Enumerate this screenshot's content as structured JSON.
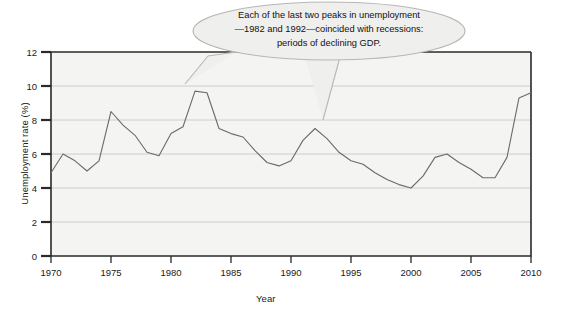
{
  "chart_data": {
    "type": "line",
    "title": "",
    "xlabel": "Year",
    "ylabel": "Unemployment rate (%)",
    "xlim": [
      1970,
      2010
    ],
    "ylim": [
      0,
      12
    ],
    "xticks": [
      1970,
      1975,
      1980,
      1985,
      1990,
      1995,
      2000,
      2005,
      2010
    ],
    "yticks": [
      0,
      2,
      4,
      6,
      8,
      10,
      12
    ],
    "xtick_labels": [
      "1970",
      "1975",
      "1980",
      "1985",
      "1990",
      "1995",
      "2000",
      "2005",
      "2010"
    ],
    "ytick_labels": [
      "0",
      "2",
      "4",
      "6",
      "8",
      "10",
      "12"
    ],
    "grid": "horizontal",
    "legend": "none",
    "series": [
      {
        "name": "Unemployment rate",
        "color": "#6a6a6a",
        "x": [
          1970,
          1971,
          1972,
          1973,
          1974,
          1975,
          1976,
          1977,
          1978,
          1979,
          1980,
          1981,
          1982,
          1983,
          1984,
          1985,
          1986,
          1987,
          1988,
          1989,
          1990,
          1991,
          1992,
          1993,
          1994,
          1995,
          1996,
          1997,
          1998,
          1999,
          2000,
          2001,
          2002,
          2003,
          2004,
          2005,
          2006,
          2007,
          2008,
          2009,
          2010
        ],
        "values": [
          4.9,
          6.0,
          5.6,
          5.0,
          5.6,
          8.5,
          7.7,
          7.1,
          6.1,
          5.9,
          7.2,
          7.6,
          9.7,
          9.6,
          7.5,
          7.2,
          7.0,
          6.2,
          5.5,
          5.3,
          5.6,
          6.8,
          7.5,
          6.9,
          6.1,
          5.6,
          5.4,
          4.9,
          4.5,
          4.2,
          4.0,
          4.7,
          5.8,
          6.0,
          5.5,
          5.1,
          4.6,
          4.6,
          5.8,
          9.3,
          9.6
        ]
      }
    ],
    "annotations": [
      {
        "name": "recession-callout",
        "lines": [
          "Each of the last two peaks in unemployment",
          "—1982 and 1992—coincided with recessions:",
          "periods of declining GDP."
        ],
        "points_to": [
          1982,
          1992
        ]
      }
    ]
  },
  "figure": {
    "frame_color": "#2a2a2a",
    "grid_color": "#c8c8c8",
    "plot_bg": "#f4f4f2",
    "callout_fill": "#efefed",
    "callout_stroke": "#b6b6b4"
  }
}
